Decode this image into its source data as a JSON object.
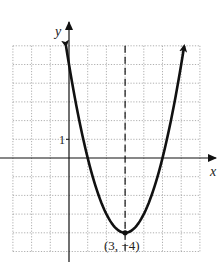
{
  "chart_data": {
    "type": "line",
    "title": "",
    "xlabel": "x",
    "ylabel": "y",
    "xlim": [
      -3,
      7
    ],
    "ylim": [
      -5,
      6
    ],
    "grid": true,
    "grid_step": 1,
    "tick_labels": [
      {
        "axis": "y",
        "value": 1,
        "text": "1"
      }
    ],
    "series": [
      {
        "name": "parabola",
        "equation": "y = (x - 3)^2 - 4",
        "x": [
          -0.16,
          0,
          0.5,
          1,
          1.5,
          2,
          2.5,
          3,
          3.5,
          4,
          4.5,
          5,
          5.5,
          6,
          6.16
        ],
        "y": [
          6.0,
          5,
          2.25,
          0,
          -1.75,
          -3,
          -3.75,
          -4,
          -3.75,
          -3,
          -1.75,
          0,
          2.25,
          5,
          6.0
        ],
        "arrows": "both-ends"
      }
    ],
    "axis_of_symmetry": {
      "x": 3,
      "style": "dashed"
    },
    "annotations": [
      {
        "text": "(3, −4)",
        "point": [
          3,
          -4
        ]
      }
    ]
  }
}
